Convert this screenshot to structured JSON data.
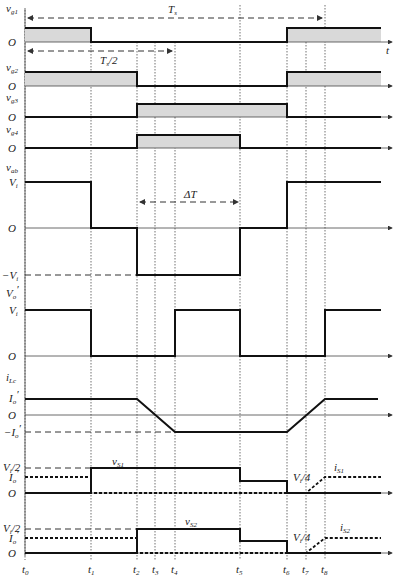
{
  "diagram": {
    "type": "timing-waveform",
    "time_axis": {
      "label": "t",
      "ticks": [
        "t0",
        "t1",
        "t2",
        "t3",
        "t4",
        "t5",
        "t6",
        "t7",
        "t8"
      ]
    },
    "period_annotations": {
      "full_period": "Ts",
      "half_period": "Ts/2",
      "delta": "ΔT"
    },
    "traces": [
      {
        "id": "vg1",
        "label": "vg1",
        "levels": [
          "O"
        ],
        "pattern": "high t0-t1, low t1-t6, high t6-end"
      },
      {
        "id": "vg2",
        "label": "vg2",
        "levels": [
          "O"
        ],
        "pattern": "high t0-t2, low t2-t6, high t6-end"
      },
      {
        "id": "vg3",
        "label": "vg3",
        "levels": [
          "O"
        ],
        "pattern": "low t0-t2, high t2-t6, low t6-end"
      },
      {
        "id": "vg4",
        "label": "vg4",
        "levels": [
          "O"
        ],
        "pattern": "low t0-t2, high t2-t5, low t5-end"
      },
      {
        "id": "vab",
        "label": "vab",
        "levels": [
          "Vi",
          "O",
          "-Vi"
        ],
        "pattern": "Vi t0-t1, O t1-t2, -Vi t2-t5, O t5-t6, Vi t6-end"
      },
      {
        "id": "vo",
        "label": "Vo'",
        "levels": [
          "Vi",
          "O"
        ],
        "pattern": "Vi t0-t1, O t1-t4, Vi t4-t5, O t5-t8, Vi t8-end"
      },
      {
        "id": "iLc",
        "label": "iLc",
        "levels": [
          "Io'",
          "O",
          "-Io'"
        ],
        "pattern": "Io' t0-t2, ramp down t2-t4, -Io' t4-t6, ramp up t6-t8, Io' t8-end"
      },
      {
        "id": "vS1",
        "label": "vS1",
        "current_label": "iS1",
        "levels": [
          "Vi/2",
          "Io'",
          "O"
        ],
        "mid_level": "Vi/4"
      },
      {
        "id": "vS2",
        "label": "vS2",
        "current_label": "iS2",
        "levels": [
          "Vi/2",
          "Io'",
          "O"
        ],
        "mid_level": "Vi/4"
      }
    ]
  },
  "labels": {
    "vg1": "v",
    "vg1_sub": "g1",
    "vg2": "v",
    "vg2_sub": "g2",
    "vg3": "v",
    "vg3_sub": "g3",
    "vg4": "v",
    "vg4_sub": "g4",
    "vab": "v",
    "vab_sub": "ab",
    "vo": "V",
    "vo_sub": "o",
    "vo_prime": "′",
    "iLc": "i",
    "iLc_sub": "Lc",
    "O": "O",
    "Vi": "V",
    "Vi_sub": "i",
    "negVi": "−V",
    "Io": "I",
    "Io_sub": "o",
    "prime": "′",
    "negIo": "−I",
    "Vi2": "V",
    "Vi2_tail": "/2",
    "Vi4": "V",
    "Vi4_tail": "/4",
    "vS1": "v",
    "vS1_sub": "S1",
    "vS2": "v",
    "vS2_sub": "S2",
    "iS1": "i",
    "iS1_sub": "S1",
    "iS2": "i",
    "iS2_sub": "S2",
    "Ts": "T",
    "Ts_sub": "s",
    "Ts2_tail": "/2",
    "dT": "ΔT",
    "t": "t",
    "t_base": "t",
    "t0": "0",
    "t1": "1",
    "t2": "2",
    "t3": "3",
    "t4": "4",
    "t5": "5",
    "t6": "6",
    "t7": "7",
    "t8": "8"
  }
}
